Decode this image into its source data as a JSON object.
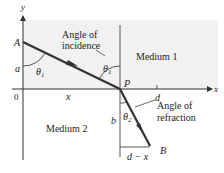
{
  "diagram": {
    "type": "refraction-geometry",
    "colors": {
      "medium1_fill": "#f1f1f1",
      "medium2_fill": "#ffffff",
      "axis": "#333333",
      "ray": "#333333",
      "text": "#222222"
    },
    "axes": {
      "x_label": "x",
      "y_label": "y",
      "origin_label": "0"
    },
    "points": {
      "A": "A",
      "P": "P",
      "B": "B"
    },
    "segments": {
      "a": "a",
      "b": "b",
      "x": "x",
      "d": "d",
      "d_minus_x": "d − x"
    },
    "angles": {
      "theta1": "θ",
      "theta1_sub": "1",
      "theta2": "θ",
      "theta2_sub": "2"
    },
    "annotations": {
      "incidence_line1": "Angle of",
      "incidence_line2": "incidence",
      "refraction_line1": "Angle of",
      "refraction_line2": "refraction"
    },
    "regions": {
      "medium1": "Medium 1",
      "medium2": "Medium 2"
    }
  }
}
